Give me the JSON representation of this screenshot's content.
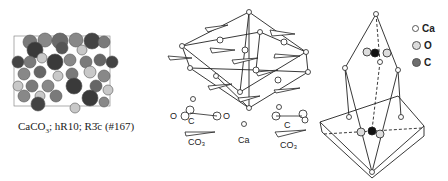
{
  "figure": {
    "panels": [
      {
        "id": "unit-cell-packing",
        "caption_parts": {
          "formula_base": "CaCO",
          "formula_sub": "3",
          "rest": "; hR10; R",
          "bar3": "3̄",
          "suffix": "c (#167)"
        }
      },
      {
        "id": "rhombohedral-cell-ions",
        "labels": {
          "co3_left": "CO₃",
          "ca": "Ca",
          "co3_right": "CO₃",
          "c_left": "C",
          "c_right": "C",
          "o": "O"
        }
      },
      {
        "id": "coordination-polyhedron"
      }
    ],
    "legend": [
      {
        "label": "Ca",
        "color": "#ffffff",
        "size": 5
      },
      {
        "label": "O",
        "color": "#dcdcdc",
        "size": 7
      },
      {
        "label": "C",
        "color": "#6e6e6e",
        "size": 7
      }
    ],
    "colors": {
      "atom_dark": "#3a3a3a",
      "atom_mid": "#7a7a7a",
      "atom_light": "#c8c8c8",
      "line": "#222222"
    }
  }
}
